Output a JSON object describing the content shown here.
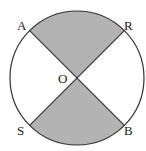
{
  "diagram": {
    "type": "circle-sectors",
    "center_label": "O",
    "points": [
      {
        "name": "A",
        "position": "upper-left"
      },
      {
        "name": "R",
        "position": "upper-right"
      },
      {
        "name": "S",
        "position": "lower-left"
      },
      {
        "name": "B",
        "position": "lower-right"
      }
    ],
    "shaded_sectors": [
      "AOR (top)",
      "SOB (bottom)"
    ],
    "colors": {
      "shade": "#b3b3b3",
      "stroke": "#333333",
      "background": "#ffffff"
    }
  }
}
